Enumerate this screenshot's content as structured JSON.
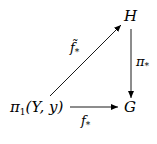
{
  "diagram": {
    "type": "commutative-diagram",
    "nodes": {
      "source": {
        "base": "π",
        "sub": "1",
        "args": "(Y, y)"
      },
      "top": {
        "label": "H"
      },
      "right": {
        "label": "G"
      }
    },
    "arrows": [
      {
        "from": "source",
        "to": "top",
        "label_base": "f̃",
        "label_sub": "*"
      },
      {
        "from": "top",
        "to": "right",
        "label_base": "π",
        "label_sub": "*"
      },
      {
        "from": "source",
        "to": "right",
        "label_base": "f",
        "label_sub": "*"
      }
    ],
    "colors": {
      "ink": "#000000",
      "background": "#ffffff"
    }
  }
}
